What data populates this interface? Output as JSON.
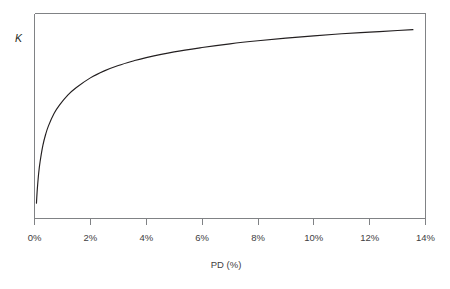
{
  "chart_data": {
    "type": "line",
    "title": "",
    "xlabel": "PD (%)",
    "ylabel": "K",
    "xlim": [
      0,
      14
    ],
    "ylim": [
      0,
      1
    ],
    "grid": false,
    "legend": "none",
    "xticks": [
      0,
      2,
      4,
      6,
      8,
      10,
      12,
      14
    ],
    "xticklabels": [
      "0%",
      "2%",
      "4%",
      "6%",
      "8%",
      "10%",
      "12%",
      "14%"
    ],
    "yticks": [],
    "yticklabels": [],
    "series": [
      {
        "name": "K",
        "x": [
          0.07,
          0.1,
          0.15,
          0.2,
          0.3,
          0.4,
          0.5,
          0.7,
          0.9,
          1.2,
          1.5,
          2.0,
          2.5,
          3.0,
          3.5,
          4.0,
          5.0,
          6.0,
          7.0,
          8.0,
          9.0,
          10.0,
          11.0,
          12.0,
          13.0,
          13.55
        ],
        "y": [
          0.075,
          0.142,
          0.222,
          0.277,
          0.357,
          0.411,
          0.452,
          0.512,
          0.554,
          0.603,
          0.639,
          0.686,
          0.72,
          0.746,
          0.767,
          0.785,
          0.813,
          0.834,
          0.852,
          0.867,
          0.88,
          0.891,
          0.901,
          0.909,
          0.917,
          0.921
        ]
      }
    ],
    "annotations": []
  },
  "axis": {
    "y_label": "K",
    "x_label": "PD (%)",
    "x_tick_labels": [
      "0%",
      "2%",
      "4%",
      "6%",
      "8%",
      "10%",
      "12%",
      "14%"
    ]
  },
  "colors": {
    "curve": "#231f20",
    "axis": "#808285",
    "text": "#414042",
    "background": "#ffffff"
  }
}
